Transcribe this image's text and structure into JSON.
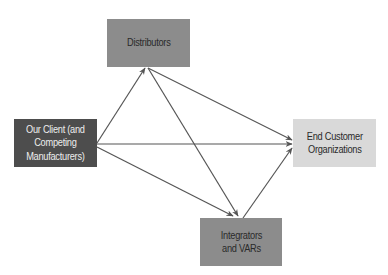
{
  "diagram": {
    "type": "flow",
    "colors": {
      "background": "#ffffff",
      "edge": "#555555",
      "dark_node": "#4d4d4d",
      "medium_node": "#8c8c8c",
      "light_node": "#d9d9d9",
      "dark_text": "#2a2a2a",
      "light_text": "#eeeeee"
    },
    "nodes": {
      "client": {
        "label": "Our Client (and\nCompeting\nManufacturers)",
        "fill": "#4d4d4d",
        "text_color": "#eeeeee"
      },
      "distributors": {
        "label": "Distributors",
        "fill": "#8c8c8c",
        "text_color": "#2a2a2a"
      },
      "integrators": {
        "label": "Integrators\nand VARs",
        "fill": "#8c8c8c",
        "text_color": "#2a2a2a"
      },
      "end_customer": {
        "label": "End Customer\nOrganizations",
        "fill": "#d9d9d9",
        "text_color": "#2a2a2a"
      }
    },
    "edges": [
      {
        "from": "client",
        "to": "distributors"
      },
      {
        "from": "client",
        "to": "end_customer"
      },
      {
        "from": "client",
        "to": "integrators"
      },
      {
        "from": "distributors",
        "to": "end_customer"
      },
      {
        "from": "distributors",
        "to": "integrators"
      },
      {
        "from": "integrators",
        "to": "end_customer"
      }
    ]
  }
}
